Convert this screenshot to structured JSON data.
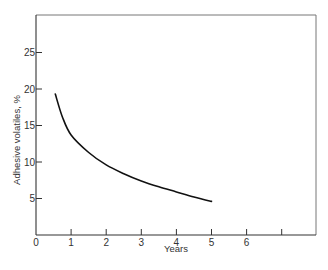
{
  "chart_data": {
    "type": "line",
    "title": "",
    "xlabel": "Years",
    "ylabel": "Adhesive volatiles, %",
    "xlim": [
      0,
      8
    ],
    "ylim": [
      0,
      30
    ],
    "x_ticks": [
      0,
      1,
      2,
      3,
      4,
      5,
      6,
      7
    ],
    "x_tick_labels": [
      "0",
      "1",
      "2",
      "3",
      "4",
      "5",
      "6",
      ""
    ],
    "y_ticks": [
      5,
      10,
      15,
      20,
      25
    ],
    "y_tick_labels": [
      "5",
      "10",
      "15",
      "20",
      "25"
    ],
    "grid": false,
    "legend": null,
    "series": [
      {
        "name": "Adhesive volatiles",
        "x": [
          0.55,
          0.75,
          1.0,
          1.5,
          2.0,
          2.5,
          3.0,
          3.5,
          4.0,
          4.5,
          5.0
        ],
        "y": [
          19.3,
          16.2,
          13.7,
          11.3,
          9.6,
          8.4,
          7.4,
          6.6,
          5.9,
          5.2,
          4.6
        ]
      }
    ]
  }
}
